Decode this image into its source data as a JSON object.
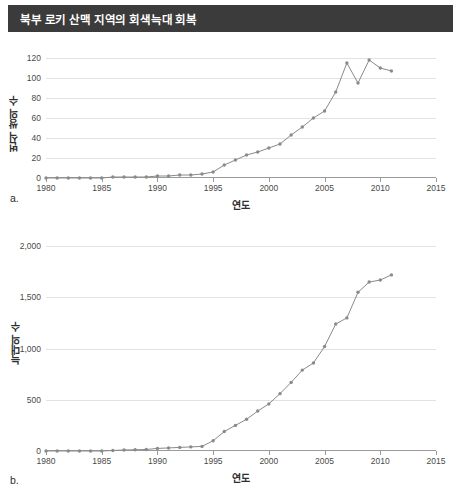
{
  "figure": {
    "title": "북부 로키 산맥 지역의 회색늑대 회복",
    "panel_a_letter": "a.",
    "panel_b_letter": "b."
  },
  "chart_data": [
    {
      "type": "line",
      "panel": "a",
      "title": "북부 로키 산맥 지역의 회색늑대 회복",
      "xlabel": "연도",
      "ylabel": "번식 쌍의 수",
      "xlim": [
        1980,
        2015
      ],
      "ylim": [
        0,
        130
      ],
      "xticks": [
        1980,
        1985,
        1990,
        1995,
        2000,
        2005,
        2010,
        2015
      ],
      "xticklabels": [
        "1980",
        "1985",
        "1990",
        "1995",
        "2000",
        "2005",
        "2010",
        "2015"
      ],
      "yticks": [
        0,
        20,
        40,
        60,
        80,
        100,
        120
      ],
      "yticklabels": [
        "0",
        "20",
        "40",
        "60",
        "80",
        "100",
        "120"
      ],
      "grid": true,
      "legend": "none",
      "marker": "circle",
      "color": "#8a8a8a",
      "x": [
        1980,
        1981,
        1982,
        1983,
        1984,
        1985,
        1986,
        1987,
        1988,
        1989,
        1990,
        1991,
        1992,
        1993,
        1994,
        1995,
        1996,
        1997,
        1998,
        1999,
        2000,
        2001,
        2002,
        2003,
        2004,
        2005,
        2006,
        2007,
        2008,
        2009,
        2010,
        2011
      ],
      "y": [
        0,
        0,
        0,
        0,
        0,
        0,
        1,
        1,
        1,
        1,
        2,
        2,
        3,
        3,
        4,
        6,
        13,
        18,
        23,
        26,
        30,
        34,
        43,
        51,
        60,
        67,
        86,
        115,
        95,
        118,
        110,
        107
      ]
    },
    {
      "type": "line",
      "panel": "b",
      "xlabel": "연도",
      "ylabel": "늑대의 수",
      "xlim": [
        1980,
        2015
      ],
      "ylim": [
        0,
        2100
      ],
      "xticks": [
        1980,
        1985,
        1990,
        1995,
        2000,
        2005,
        2010,
        2015
      ],
      "xticklabels": [
        "1980",
        "1985",
        "1990",
        "1995",
        "2000",
        "2005",
        "2010",
        "2015"
      ],
      "yticks": [
        0,
        500,
        1000,
        1500,
        2000
      ],
      "yticklabels": [
        "0",
        "500",
        "1,000",
        "1,500",
        "2,000"
      ],
      "grid": true,
      "legend": "none",
      "marker": "circle",
      "color": "#8a8a8a",
      "x": [
        1980,
        1981,
        1982,
        1983,
        1984,
        1985,
        1986,
        1987,
        1988,
        1989,
        1990,
        1991,
        1992,
        1993,
        1994,
        1995,
        1996,
        1997,
        1998,
        1999,
        2000,
        2001,
        2002,
        2003,
        2004,
        2005,
        2006,
        2007,
        2008,
        2009,
        2010,
        2011
      ],
      "y": [
        0,
        0,
        0,
        0,
        0,
        0,
        5,
        10,
        12,
        15,
        25,
        30,
        35,
        40,
        45,
        100,
        190,
        250,
        310,
        390,
        460,
        560,
        670,
        790,
        860,
        1020,
        1240,
        1300,
        1550,
        1650,
        1670,
        1720
      ]
    }
  ]
}
